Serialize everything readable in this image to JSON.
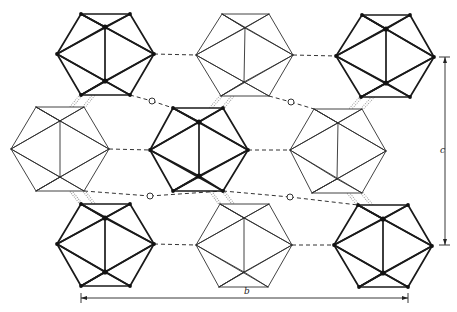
{
  "diagram": {
    "colors": {
      "dark": "#1a1a1a",
      "light": "#2e2e2e",
      "background": "#ffffff"
    },
    "icosahedra": [
      {
        "id": "top-left",
        "style": "dark",
        "v": [
          [
            81,
            14
          ],
          [
            130,
            14
          ],
          [
            154,
            54
          ],
          [
            130,
            95
          ],
          [
            81,
            95
          ],
          [
            57,
            54
          ]
        ],
        "inner": [
          [
            105,
            27
          ],
          [
            105,
            81
          ]
        ]
      },
      {
        "id": "top-middle",
        "style": "light",
        "v": [
          [
            222,
            14
          ],
          [
            269,
            14
          ],
          [
            293,
            55
          ],
          [
            269,
            96
          ],
          [
            221,
            96
          ],
          [
            196,
            55
          ]
        ],
        "inner": [
          [
            245,
            28
          ],
          [
            244,
            82
          ]
        ]
      },
      {
        "id": "top-right",
        "style": "dark",
        "v": [
          [
            362,
            15
          ],
          [
            410,
            15
          ],
          [
            434,
            57
          ],
          [
            410,
            97
          ],
          [
            361,
            97
          ],
          [
            336,
            56
          ]
        ],
        "inner": [
          [
            386,
            29
          ],
          [
            386,
            83
          ]
        ]
      },
      {
        "id": "mid-left",
        "style": "light",
        "v": [
          [
            36,
            107
          ],
          [
            84,
            107
          ],
          [
            109,
            149
          ],
          [
            84,
            191
          ],
          [
            36,
            191
          ],
          [
            11,
            149
          ]
        ],
        "inner": [
          [
            60,
            121
          ],
          [
            60,
            177
          ]
        ]
      },
      {
        "id": "mid-center",
        "style": "dark",
        "v": [
          [
            173,
            108
          ],
          [
            223,
            108
          ],
          [
            248,
            150
          ],
          [
            223,
            191
          ],
          [
            173,
            191
          ],
          [
            150,
            150
          ]
        ],
        "inner": [
          [
            199,
            122
          ],
          [
            199,
            176
          ]
        ]
      },
      {
        "id": "mid-right",
        "style": "light",
        "v": [
          [
            314,
            109
          ],
          [
            362,
            109
          ],
          [
            386,
            151
          ],
          [
            362,
            193
          ],
          [
            312,
            193
          ],
          [
            290,
            150
          ]
        ],
        "inner": [
          [
            338,
            123
          ],
          [
            337,
            179
          ]
        ]
      },
      {
        "id": "bottom-left",
        "style": "dark",
        "v": [
          [
            81,
            204
          ],
          [
            130,
            204
          ],
          [
            154,
            244
          ],
          [
            130,
            286
          ],
          [
            81,
            286
          ],
          [
            57,
            244
          ]
        ],
        "inner": [
          [
            105,
            218
          ],
          [
            105,
            272
          ]
        ]
      },
      {
        "id": "bottom-middle",
        "style": "light",
        "v": [
          [
            220,
            204
          ],
          [
            269,
            204
          ],
          [
            292,
            245
          ],
          [
            268,
            287
          ],
          [
            219,
            287
          ],
          [
            196,
            245
          ]
        ],
        "inner": [
          [
            244,
            218
          ],
          [
            244,
            272
          ]
        ]
      },
      {
        "id": "bottom-right",
        "style": "dark",
        "v": [
          [
            358,
            205
          ],
          [
            408,
            205
          ],
          [
            432,
            246
          ],
          [
            408,
            287
          ],
          [
            359,
            287
          ],
          [
            334,
            245
          ]
        ],
        "inner": [
          [
            383,
            219
          ],
          [
            383,
            273
          ]
        ]
      }
    ],
    "dashed_bonds": [
      [
        [
          154,
          54
        ],
        [
          196,
          55
        ]
      ],
      [
        [
          293,
          55
        ],
        [
          336,
          56
        ]
      ],
      [
        [
          109,
          149
        ],
        [
          150,
          150
        ]
      ],
      [
        [
          248,
          150
        ],
        [
          290,
          150
        ]
      ],
      [
        [
          154,
          244
        ],
        [
          196,
          245
        ]
      ],
      [
        [
          292,
          245
        ],
        [
          334,
          245
        ]
      ]
    ],
    "interstitial_bonds": [
      {
        "from": [
          130,
          95
        ],
        "via": [
          152,
          101
        ],
        "to": [
          173,
          108
        ]
      },
      {
        "from": [
          269,
          96
        ],
        "via": [
          291,
          102
        ],
        "to": [
          314,
          109
        ]
      },
      {
        "from": [
          84,
          191
        ],
        "via": [
          150,
          196
        ],
        "to": [
          223,
          191
        ],
        "alt_from": [
          130,
          204
        ]
      },
      {
        "from": [
          223,
          191
        ],
        "via": [
          290,
          197
        ],
        "to": [
          358,
          205
        ]
      }
    ],
    "hatched_bonds": [
      [
        [
          81,
          95
        ],
        [
          60,
          121
        ]
      ],
      [
        [
          105,
          81
        ],
        [
          84,
          107
        ]
      ],
      [
        [
          221,
          96
        ],
        [
          199,
          122
        ]
      ],
      [
        [
          244,
          82
        ],
        [
          223,
          108
        ]
      ],
      [
        [
          361,
          97
        ],
        [
          338,
          123
        ]
      ],
      [
        [
          386,
          83
        ],
        [
          362,
          109
        ]
      ],
      [
        [
          60,
          177
        ],
        [
          81,
          204
        ]
      ],
      [
        [
          84,
          191
        ],
        [
          105,
          218
        ]
      ],
      [
        [
          199,
          176
        ],
        [
          220,
          204
        ]
      ],
      [
        [
          223,
          191
        ],
        [
          244,
          218
        ]
      ],
      [
        [
          337,
          179
        ],
        [
          358,
          205
        ]
      ],
      [
        [
          362,
          193
        ],
        [
          383,
          219
        ]
      ]
    ],
    "axes": {
      "c": {
        "label": "c",
        "x": 445,
        "y1": 57,
        "y2": 245,
        "label_x": 440,
        "label_y": 153
      },
      "b": {
        "label": "b",
        "y": 298,
        "x1": 81,
        "x2": 408,
        "label_x": 244,
        "label_y": 294
      }
    }
  }
}
